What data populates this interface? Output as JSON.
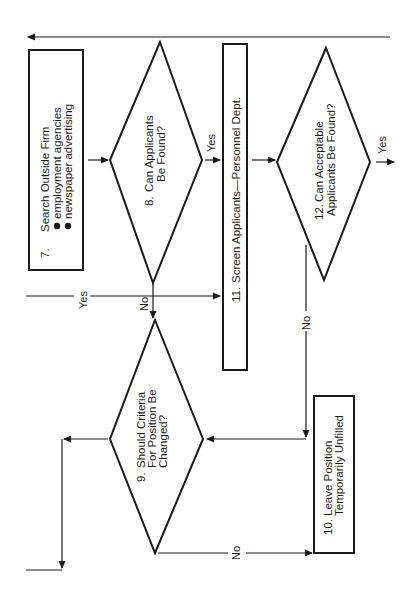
{
  "diagram": {
    "orientation": "rotated 90deg counter-clockwise",
    "colors": {
      "ink": "#1a1a1a",
      "background": "#ffffff"
    },
    "nodes": {
      "n7": {
        "type": "process",
        "number": "7.",
        "title": "Search Outside Firm",
        "bullets": [
          "employment agencies",
          "newspaper advertising"
        ]
      },
      "n8": {
        "type": "decision",
        "number": "8.",
        "line1": "Can Applicants",
        "line2": "Be Found?"
      },
      "n9": {
        "type": "decision",
        "number": "9.",
        "line1": "Should Criteria",
        "line2": "For Position Be",
        "line3": "Changed?"
      },
      "n10": {
        "type": "process",
        "number": "10.",
        "line1": "Leave Position",
        "line2": "Temporarily Unfilled"
      },
      "n11": {
        "type": "process",
        "number": "11.",
        "title": "Screen Applicants—Personnel Dept."
      },
      "n12": {
        "type": "decision",
        "number": "12.",
        "line1": "Can Acceptable",
        "line2": "Applicants Be Found?"
      }
    },
    "edge_labels": {
      "n8_yes": "Yes",
      "n8_no": "No",
      "incoming_yes": "Yes",
      "n12_yes": "Yes",
      "n12_no": "No",
      "n9_no": "No"
    }
  }
}
